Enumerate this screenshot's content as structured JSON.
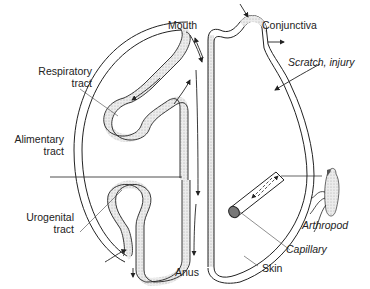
{
  "diagram": {
    "labels": {
      "mouth": "Mouth",
      "conjunctiva": "Conjunctiva",
      "respiratory_1": "Respiratory",
      "respiratory_2": "tract",
      "scratch": "Scratch, injury",
      "alimentary_1": "Alimentary",
      "alimentary_2": "tract",
      "urogenital_1": "Urogenital",
      "urogenital_2": "tract",
      "arthropod": "Arthropod",
      "capillary": "Capillary",
      "anus": "Anus",
      "skin": "Skin"
    },
    "colors": {
      "line": "#222222",
      "stipple": "#d8d8d8",
      "background": "#ffffff"
    }
  }
}
